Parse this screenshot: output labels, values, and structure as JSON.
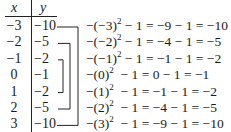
{
  "header": {
    "x_label": "x",
    "y_label": "y"
  },
  "rows": [
    {
      "x": "−3",
      "y": "−10",
      "calc_pre": "−(−3)",
      "exp": "2",
      "calc_post": " − 1 = −9 − 1 = −10"
    },
    {
      "x": "−2",
      "y": "−5",
      "calc_pre": "−(−2)",
      "exp": "2",
      "calc_post": " − 1 = −4 − 1 = −5"
    },
    {
      "x": "−1",
      "y": "−2",
      "calc_pre": "−(−1)",
      "exp": "2",
      "calc_post": " − 1 = −1 − 1 = −2"
    },
    {
      "x": "0",
      "y": "−1",
      "calc_pre": "−(0)",
      "exp": "2",
      "calc_post": "  − 1 = 0 − 1 = −1"
    },
    {
      "x": "1",
      "y": "−2",
      "calc_pre": "−(1)",
      "exp": "2",
      "calc_post": "  − 1 = −1 − 1 = −2"
    },
    {
      "x": "2",
      "y": "−5",
      "calc_pre": "−(2)",
      "exp": "2",
      "calc_post": "  − 1 = −4 − 1 = −5"
    },
    {
      "x": "3",
      "y": "−10",
      "calc_pre": "−(3)",
      "exp": "2",
      "calc_post": "  − 1 = −9 − 1 = −10"
    }
  ],
  "bracket_pairs": [
    [
      0,
      6
    ],
    [
      1,
      5
    ],
    [
      2,
      4
    ]
  ]
}
